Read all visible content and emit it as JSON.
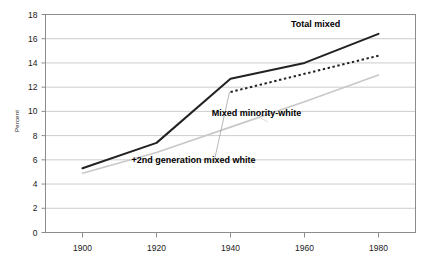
{
  "chart_data": {
    "type": "line",
    "title": "",
    "xlabel": "",
    "ylabel": "Percent",
    "xlim": [
      1890,
      1990
    ],
    "ylim": [
      0,
      18
    ],
    "grid": true,
    "legend_position": "inline-annotations",
    "x": [
      1900,
      1920,
      1940,
      1960,
      1980
    ],
    "yticks": [
      "0",
      "2",
      "4",
      "6",
      "8",
      "10",
      "12",
      "14",
      "16",
      "18"
    ],
    "xticks": [
      "1900",
      "1920",
      "1940",
      "1960",
      "1980"
    ],
    "series": [
      {
        "name": "Total mixed",
        "style": "solid",
        "color": "#222222",
        "x": [
          1900,
          1920,
          1940,
          1960,
          1980
        ],
        "values": [
          5.3,
          7.4,
          12.7,
          14.0,
          16.4
        ]
      },
      {
        "name": "+2nd generation mixed white",
        "style": "dotted",
        "color": "#222222",
        "x": [
          1940,
          1960,
          1980
        ],
        "values": [
          11.6,
          13.1,
          14.6
        ]
      },
      {
        "name": "Mixed minority-white",
        "style": "solid-light",
        "color": "#c8c8c8",
        "x": [
          1900,
          1920,
          1940,
          1960,
          1980
        ],
        "values": [
          4.9,
          6.6,
          8.7,
          10.8,
          13.0
        ]
      }
    ],
    "annotations": [
      {
        "text": "Total mixed",
        "x": 1963,
        "y": 17.0
      },
      {
        "text": "Mixed minority-white",
        "x": 1947,
        "y": 9.6
      },
      {
        "text": "+2nd generation mixed white",
        "x": 1930,
        "y": 5.7
      }
    ]
  }
}
